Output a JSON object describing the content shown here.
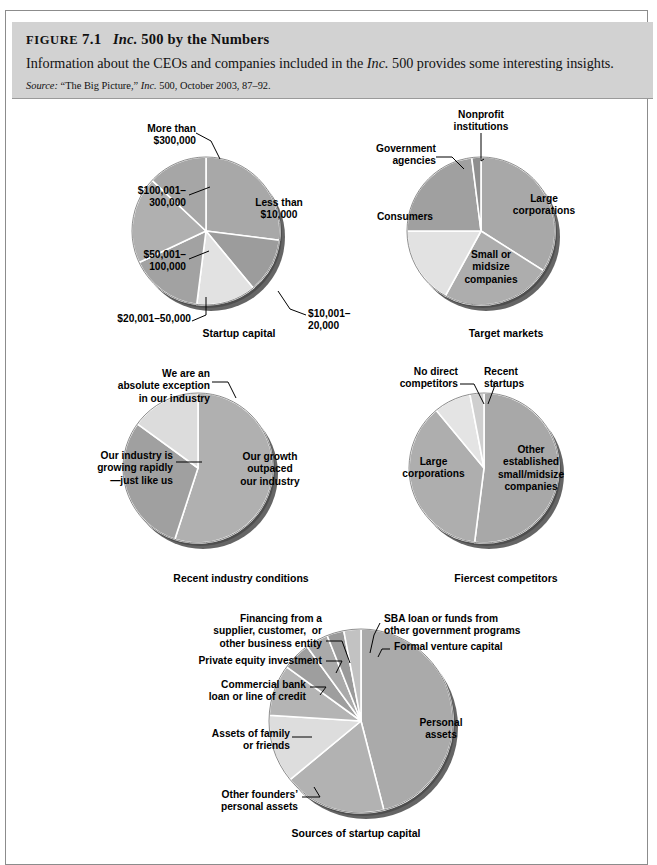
{
  "figure": {
    "label_smallcaps": "FIGURE",
    "number": "7.1",
    "title_italic": "Inc.",
    "title_rest": "500 by the Numbers",
    "description_pre": "Information about the CEOs and companies included in the ",
    "description_italic": "Inc.",
    "description_post": " 500 provides some interesting insights.",
    "source_label": "Source:",
    "source_pre": " “The Big Picture,” ",
    "source_italic": "Inc.",
    "source_post": " 500, October 2003, 87–92."
  },
  "palette": {
    "header_band": "#d2d2d2",
    "frame_border": "#8c8c8c",
    "slice_mid": "#a8a8a8",
    "slice_dark": "#919191",
    "slice_light": "#d8d8d8",
    "slice_lighter": "#e6e6e6",
    "shadow": "#4a4a4a",
    "divider": "#ffffff"
  },
  "chart_data": [
    {
      "id": "startup-capital",
      "type": "pie",
      "title": "Startup capital",
      "labels": [
        "Less than\n$10,000",
        "$10,001–\n20,000",
        "$20,001–50,000",
        "$50,001–\n100,000",
        "$100,001–\n300,000",
        "More than\n$300,000"
      ],
      "values": [
        27,
        12,
        13,
        16,
        19,
        13
      ],
      "shades": [
        "#a8a8a8",
        "#9c9c9c",
        "#e2e2e2",
        "#a2a2a2",
        "#b0b0b0",
        "#a6a6a6"
      ]
    },
    {
      "id": "target-markets",
      "type": "pie",
      "title": "Target markets",
      "labels": [
        "Large\ncorporations",
        "Small or\nmidsize\ncompanies",
        "Consumers",
        "Government\nagencies",
        "Nonprofit\ninstitutions"
      ],
      "values": [
        34,
        24,
        17,
        23,
        2
      ],
      "shades": [
        "#a8a8a8",
        "#adadad",
        "#e2e2e2",
        "#a0a0a0",
        "#8f8f8f"
      ]
    },
    {
      "id": "recent-industry-conditions",
      "type": "pie",
      "title": "Recent industry conditions",
      "labels": [
        "Our growth\noutpaced\nour industry",
        "Our industry is\ngrowing rapidly\n—just like us",
        "We are an\nabsolute exception\nin our industry"
      ],
      "values": [
        55,
        30,
        15
      ],
      "shades": [
        "#b0b0b0",
        "#a0a0a0",
        "#dcdcdc"
      ]
    },
    {
      "id": "fiercest-competitors",
      "type": "pie",
      "title": "Fiercest competitors",
      "labels": [
        "Other\nestablished\nsmall/midsize\ncompanies",
        "Large\ncorporations",
        "No direct\ncompetitors",
        "Recent\nstartups"
      ],
      "values": [
        52,
        37,
        8,
        3
      ],
      "shades": [
        "#a8a8a8",
        "#aeaeae",
        "#e4e4e4",
        "#cfcfcf"
      ]
    },
    {
      "id": "sources-of-startup-capital",
      "type": "pie",
      "title": "Sources of startup capital",
      "labels": [
        "Personal\nassets",
        "Other founders’\npersonal assets",
        "Assets of family\nor friends",
        "Commercial bank\nloan or line of credit",
        "Private equity investment",
        "Financing from a\nsupplier, customer,  or\nother business entity",
        "SBA loan or funds from\nother government programs",
        "Formal venture capital"
      ],
      "values": [
        46,
        18,
        12,
        9,
        5,
        4,
        3,
        3
      ],
      "shades": [
        "#aaaaaa",
        "#b2b2b2",
        "#dddddd",
        "#b4b4b4",
        "#9e9e9e",
        "#aaaaaa",
        "#9a9a9a",
        "#c2c2c2"
      ]
    }
  ]
}
